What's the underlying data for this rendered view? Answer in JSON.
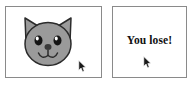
{
  "canvas": {
    "width": 192,
    "height": 86,
    "background": "#ffffff"
  },
  "panels": {
    "cat": {
      "name": "cat-face-panel",
      "border_color": "#8a8a8a",
      "background": "#ffffff",
      "illustration": {
        "icon_name": "cat-face-icon",
        "fill": "#9a9a9a",
        "outline": "#2b2b2b",
        "eye_fill": "#141414",
        "eye_highlight": "#ffffff",
        "nose_fill": "#3a3a3a",
        "description": "gray cat face with pointed ears, two eyes, nose and W mouth"
      },
      "cursor": {
        "icon_name": "mouse-pointer-icon",
        "x": 72,
        "y": 52,
        "color": "#1a1a1a"
      }
    },
    "message": {
      "name": "message-panel",
      "border_color": "#8a8a8a",
      "background": "#ffffff",
      "text": "You lose!",
      "text_color": "#111111",
      "cursor": {
        "icon_name": "mouse-pointer-icon",
        "x": 142,
        "y": 54,
        "color": "#1a1a1a"
      }
    }
  }
}
